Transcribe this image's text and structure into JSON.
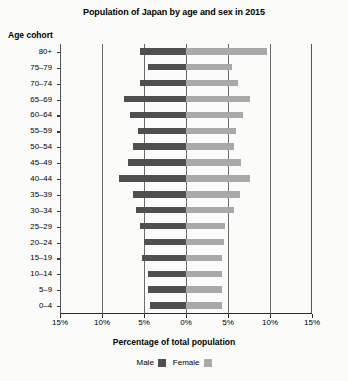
{
  "chart_data": {
    "type": "bar",
    "title": "Population of Japan by age and sex in 2015",
    "xlabel": "Percentage of total population",
    "ylabel": "Age cohort",
    "orientation": "horizontal-diverging",
    "categories": [
      "80+",
      "75–79",
      "70–74",
      "65–69",
      "60–64",
      "55–59",
      "50–54",
      "45–49",
      "40–44",
      "35–39",
      "30–34",
      "25–29",
      "20–24",
      "15–19",
      "10–14",
      "5–9",
      "0–4"
    ],
    "series": [
      {
        "name": "Male",
        "color": "#4f4f4f",
        "direction": "left",
        "values": [
          5.5,
          4.5,
          5.5,
          7.4,
          6.7,
          5.7,
          6.3,
          6.9,
          8.0,
          6.3,
          6.0,
          5.5,
          5.0,
          5.2,
          4.5,
          4.5,
          4.3
        ]
      },
      {
        "name": "Female",
        "color": "#a9a9a9",
        "direction": "right",
        "values": [
          9.6,
          5.5,
          6.2,
          7.6,
          6.8,
          6.0,
          5.7,
          6.5,
          7.6,
          6.4,
          5.7,
          4.6,
          4.5,
          4.3,
          4.3,
          4.3,
          4.3
        ]
      }
    ],
    "xlim": [
      -15,
      15
    ],
    "xticks": [
      -15,
      -10,
      -5,
      0,
      5,
      10,
      15
    ],
    "xticklabels": [
      "15%",
      "10%",
      "5%",
      "0%",
      "5%",
      "10%",
      "15%"
    ],
    "gridlines": [
      -10,
      -5,
      0,
      5,
      10
    ],
    "grid": true,
    "legend_position": "bottom-center",
    "legend": [
      "Male",
      "Female"
    ]
  }
}
